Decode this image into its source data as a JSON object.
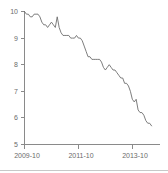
{
  "chart_data": {
    "type": "line",
    "title": "",
    "subtitle": "",
    "xlabel": "",
    "ylabel": "",
    "xlim": [
      0,
      67
    ],
    "ylim": [
      5,
      10
    ],
    "grid": false,
    "legend": null,
    "y_ticks": [
      10,
      9,
      8,
      7,
      6,
      5
    ],
    "y_tick_labels": [
      "10",
      "9",
      "8",
      "7",
      "6",
      "5"
    ],
    "x_ticks": [
      0,
      24,
      48
    ],
    "x_tick_labels": [
      "2009-10",
      "2011-10",
      "2013-10"
    ],
    "series": [
      {
        "name": "rate",
        "color": "#6e6e6e",
        "x": [
          0,
          1,
          2,
          3,
          4,
          5,
          6,
          7,
          8,
          9,
          10,
          11,
          12,
          13,
          14,
          15,
          16,
          17,
          18,
          19,
          20,
          21,
          22,
          23,
          24,
          25,
          26,
          27,
          28,
          29,
          30,
          31,
          32,
          33,
          34,
          35,
          36,
          37,
          38,
          39,
          40,
          41,
          42,
          43,
          44,
          45,
          46,
          47,
          48,
          49,
          50,
          51,
          52,
          53,
          54,
          55,
          56,
          57,
          58,
          59,
          60,
          61,
          62,
          63,
          64,
          65,
          66
        ],
        "values": [
          10.0,
          9.9,
          9.9,
          9.8,
          9.8,
          9.9,
          9.9,
          9.9,
          9.8,
          9.6,
          9.5,
          9.5,
          9.4,
          9.5,
          9.6,
          9.5,
          9.4,
          9.8,
          9.4,
          9.2,
          9.1,
          9.1,
          9.1,
          9.1,
          9.0,
          9.0,
          9.0,
          9.1,
          9.0,
          9.0,
          8.9,
          8.7,
          8.5,
          8.3,
          8.3,
          8.2,
          8.2,
          8.2,
          8.2,
          8.2,
          8.1,
          7.9,
          7.8,
          7.9,
          8.0,
          7.9,
          7.8,
          7.8,
          7.7,
          7.6,
          7.5,
          7.5,
          7.3,
          7.3,
          7.2,
          7.0,
          6.7,
          6.6,
          6.7,
          6.3,
          6.2,
          6.2,
          6.1,
          5.9,
          5.8,
          5.8,
          5.7
        ],
        "start_label": "2009-10",
        "end_value": 5.7,
        "start_value": 10.0
      }
    ]
  },
  "axes": {
    "y_axis_name": "y-axis",
    "x_axis_name": "x-axis",
    "y_tick_labels": [
      "10",
      "9",
      "8",
      "7",
      "6",
      "5"
    ],
    "x_tick_labels": [
      "2009-10",
      "2011-10",
      "2013-10"
    ]
  },
  "colors": {
    "line": "#6e6e6e",
    "axis": "#8a8a8a",
    "tick_text": "#6b6b6b",
    "rule": "#c8c8c8",
    "background": "#ffffff"
  }
}
